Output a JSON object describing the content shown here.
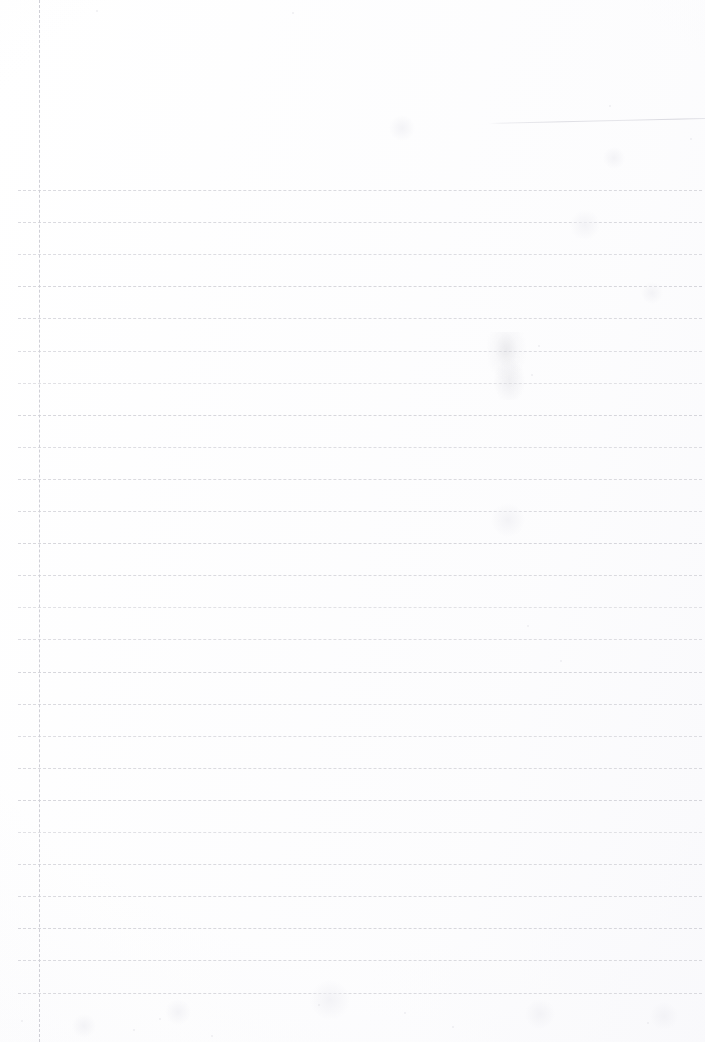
{
  "document": {
    "kind": "scanned-page",
    "subject": "blank-ruled-notebook-page",
    "title": "",
    "visible_text": "",
    "page_number": "",
    "width_px": 705,
    "height_px": 1042,
    "background_color": "#fdfdfd",
    "ink_color": "#d9d9de",
    "margin_ink_color": "#cfcfd6",
    "notes": "No legible text or handwriting is present; the page is blank apart from printed ruling and scan artifacts."
  },
  "ruling": {
    "style": "dashed",
    "horizontal": {
      "count": 26,
      "first_y": 190,
      "spacing_y": 32.1,
      "x_start": 18,
      "x_end": 702,
      "color": "#d9d9de",
      "dash_px": 7,
      "gap_px": 5,
      "thickness_px": 1
    },
    "vertical_margin": {
      "count": 1,
      "x": 39,
      "y_start": 0,
      "y_end": 1042,
      "color": "#cfcfd6",
      "dash_px": 18,
      "gap_px": 6,
      "thickness_px": 1
    }
  },
  "artifacts": {
    "scan_streak": {
      "label": "faint diagonal scanner edge streak",
      "x_start": 489,
      "y_start": 123,
      "x_end": 705,
      "y_end": 118,
      "color": "#d6d6dd"
    },
    "smudge": {
      "label": "faint faded pencil smudge",
      "x": 487,
      "y": 332,
      "width": 40,
      "height": 68
    },
    "specks": [
      {
        "x": 96,
        "y": 10,
        "size": 2
      },
      {
        "x": 292,
        "y": 12,
        "size": 2
      },
      {
        "x": 609,
        "y": 105,
        "size": 2
      },
      {
        "x": 538,
        "y": 345,
        "size": 2
      },
      {
        "x": 531,
        "y": 374,
        "size": 2
      },
      {
        "x": 690,
        "y": 138,
        "size": 2
      },
      {
        "x": 318,
        "y": 1004,
        "size": 2
      },
      {
        "x": 452,
        "y": 1026,
        "size": 2
      },
      {
        "x": 647,
        "y": 1022,
        "size": 2
      },
      {
        "x": 159,
        "y": 1018,
        "size": 2
      },
      {
        "x": 21,
        "y": 1020,
        "size": 2
      },
      {
        "x": 211,
        "y": 1035,
        "size": 2
      },
      {
        "x": 404,
        "y": 1012,
        "size": 2
      },
      {
        "x": 527,
        "y": 625,
        "size": 2
      },
      {
        "x": 560,
        "y": 660,
        "size": 2
      },
      {
        "x": 133,
        "y": 1029,
        "size": 2
      }
    ],
    "blotches": [
      {
        "x": 402,
        "y": 128,
        "size": 26
      },
      {
        "x": 585,
        "y": 225,
        "size": 30
      },
      {
        "x": 652,
        "y": 293,
        "size": 22
      },
      {
        "x": 508,
        "y": 520,
        "size": 34
      },
      {
        "x": 330,
        "y": 1000,
        "size": 40
      },
      {
        "x": 540,
        "y": 1014,
        "size": 30
      },
      {
        "x": 178,
        "y": 1012,
        "size": 26
      },
      {
        "x": 614,
        "y": 158,
        "size": 22
      },
      {
        "x": 84,
        "y": 1026,
        "size": 24
      },
      {
        "x": 664,
        "y": 1016,
        "size": 28
      }
    ]
  }
}
